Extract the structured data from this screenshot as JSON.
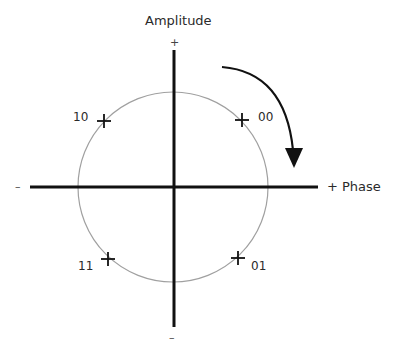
{
  "diagram": {
    "type": "constellation",
    "y_axis_label": "Amplitude",
    "x_axis_label": "+ Phase",
    "y_axis_positive_sign": "+",
    "y_axis_negative_sign": "–",
    "x_axis_negative_sign": "–",
    "rotation_direction": "clockwise",
    "circle_color": "#a0a0a0",
    "axis_color": "#111111",
    "points": [
      {
        "label": "00",
        "quadrant": "upper-right"
      },
      {
        "label": "10",
        "quadrant": "upper-left"
      },
      {
        "label": "11",
        "quadrant": "lower-left"
      },
      {
        "label": "01",
        "quadrant": "lower-right"
      }
    ]
  }
}
